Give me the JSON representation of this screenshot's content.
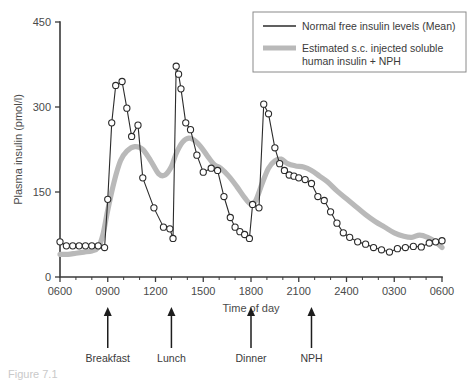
{
  "figure": {
    "caption": "Figure 7.1"
  },
  "chart_data": {
    "type": "line",
    "title": "",
    "xlabel": "Time of day",
    "ylabel": "Plasma insulin (pmol/l)",
    "ylim": [
      0,
      450
    ],
    "yticks": [
      0,
      150,
      300,
      450
    ],
    "ytick_labels": [
      "0",
      "150",
      "300",
      "450"
    ],
    "xlim": [
      6,
      30
    ],
    "xticks": [
      6,
      9,
      12,
      15,
      18,
      21,
      24,
      27,
      30
    ],
    "xtick_labels": [
      "0600",
      "0900",
      "1200",
      "1500",
      "1800",
      "2100",
      "2400",
      "0300",
      "0600"
    ],
    "xminor_step": 1,
    "grid": false,
    "legend_position": "top-right",
    "series": [
      {
        "name": "Normal free insulin levels (Mean)",
        "color": "#2b2b2b",
        "style": "thin-line-with-open-circle-markers",
        "markers": true,
        "x": [
          6.0,
          6.4,
          6.8,
          7.2,
          7.6,
          8.0,
          8.4,
          8.8,
          9.0,
          9.25,
          9.5,
          9.9,
          10.2,
          10.5,
          10.9,
          11.2,
          11.9,
          12.5,
          12.9,
          13.1,
          13.3,
          13.45,
          13.6,
          13.9,
          14.2,
          14.6,
          15.0,
          15.5,
          15.9,
          16.3,
          16.7,
          17.0,
          17.3,
          17.6,
          17.9,
          18.1,
          18.5,
          18.8,
          19.1,
          19.5,
          19.8,
          20.1,
          20.4,
          20.7,
          21.0,
          21.4,
          21.8,
          22.2,
          22.6,
          23.0,
          23.4,
          23.8,
          24.2,
          24.7,
          25.2,
          25.7,
          26.2,
          26.7,
          27.2,
          27.7,
          28.2,
          28.7,
          29.2,
          29.6,
          30.0
        ],
        "y": [
          62,
          55,
          55,
          55,
          55,
          55,
          55,
          52,
          137,
          272,
          338,
          345,
          298,
          248,
          268,
          175,
          122,
          88,
          85,
          68,
          372,
          358,
          332,
          272,
          260,
          215,
          185,
          192,
          188,
          142,
          105,
          88,
          80,
          75,
          68,
          128,
          122,
          305,
          288,
          228,
          200,
          188,
          180,
          178,
          175,
          172,
          165,
          142,
          135,
          115,
          95,
          78,
          70,
          62,
          58,
          52,
          48,
          44,
          50,
          52,
          54,
          53,
          60,
          62,
          64
        ]
      },
      {
        "name": "Estimated s.c. injected soluble human insulin + NPH",
        "color": "#b9b9b9",
        "style": "thick-smooth-line",
        "markers": false,
        "x": [
          6.0,
          6.5,
          7.0,
          7.5,
          8.0,
          8.4,
          8.7,
          9.0,
          9.4,
          9.8,
          10.2,
          10.7,
          11.2,
          11.7,
          12.2,
          12.6,
          13.0,
          13.3,
          13.7,
          14.1,
          14.5,
          14.9,
          15.3,
          15.7,
          16.1,
          16.6,
          17.1,
          17.6,
          18.0,
          18.3,
          18.7,
          19.1,
          19.5,
          19.9,
          20.3,
          20.8,
          21.3,
          21.8,
          22.3,
          22.8,
          23.4,
          24.0,
          24.6,
          25.2,
          25.8,
          26.4,
          27.0,
          27.6,
          28.1,
          28.6,
          29.1,
          29.6,
          30.0
        ],
        "y": [
          40,
          40,
          42,
          44,
          46,
          52,
          75,
          118,
          168,
          205,
          222,
          230,
          225,
          205,
          182,
          180,
          195,
          218,
          238,
          245,
          240,
          228,
          212,
          198,
          192,
          178,
          160,
          140,
          128,
          135,
          165,
          192,
          205,
          208,
          200,
          196,
          194,
          188,
          178,
          168,
          152,
          138,
          124,
          110,
          98,
          88,
          78,
          72,
          70,
          74,
          70,
          62,
          52
        ]
      }
    ],
    "annotations": [
      {
        "label": "Breakfast",
        "x_time": 9.0,
        "marker": "up-arrow"
      },
      {
        "label": "Lunch",
        "x_time": 13.0,
        "marker": "up-arrow"
      },
      {
        "label": "Dinner",
        "x_time": 18.0,
        "marker": "up-arrow"
      },
      {
        "label": "NPH",
        "x_time": 21.8,
        "marker": "up-arrow"
      }
    ],
    "legend": [
      {
        "label": "Normal free insulin levels (Mean)",
        "swatch": "thin-black-line"
      },
      {
        "label": "Estimated s.c. injected soluble",
        "label2": "human insulin + NPH",
        "swatch": "thick-gray-line"
      }
    ]
  }
}
